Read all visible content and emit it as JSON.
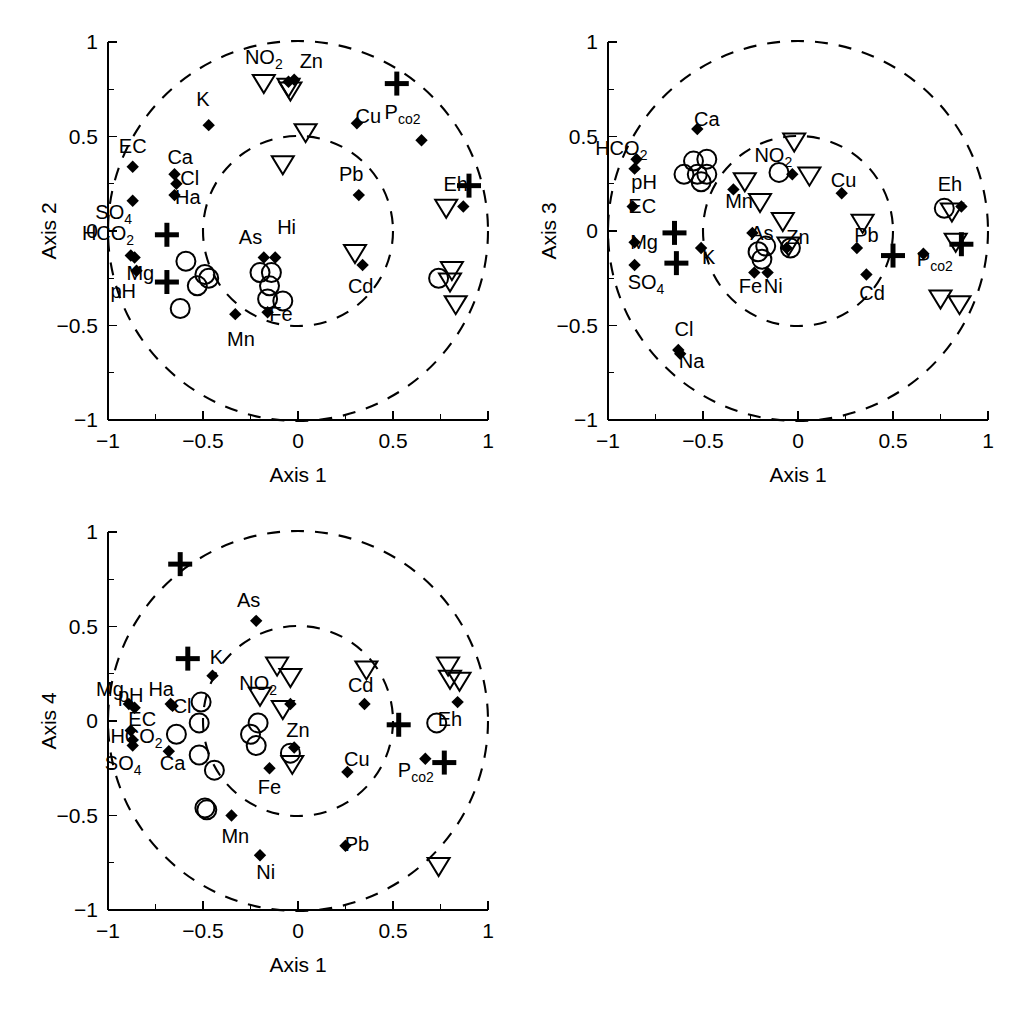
{
  "figure": {
    "panel_count": 3,
    "marker_legend": [
      "diamond",
      "open-circle",
      "open-down-triangle",
      "plus"
    ],
    "circles": [
      1.0,
      0.5
    ]
  },
  "axes": {
    "x_label": "Axis 1",
    "x_ticks": [
      "-1",
      "-0.5",
      "0",
      "0.5",
      "1"
    ],
    "x_tick_values": [
      -1,
      -0.5,
      0,
      0.5,
      1
    ],
    "y_ticks": [
      "1",
      "0.5",
      "0",
      "-0.5",
      "-1"
    ],
    "y_tick_values": [
      1,
      0.5,
      0,
      -0.5,
      -1
    ],
    "xlim": [
      -1,
      1
    ],
    "ylim": [
      -1,
      1
    ]
  },
  "chart_data": {
    "type": "scatter",
    "title": "",
    "xlabel": "Axis 1",
    "ylabel": "",
    "xlim": [
      -1,
      1
    ],
    "ylim": [
      -1,
      1
    ],
    "grid": false,
    "legend": "none",
    "annotations": {
      "unit_circle_radius": 1.0,
      "inner_circle_radius": 0.5,
      "inner_circle_center": [
        0.0,
        0.0
      ]
    },
    "panels": [
      {
        "id": "panel-axis2",
        "xlabel": "Axis 1",
        "ylabel": "Axis 2",
        "points": [
          {
            "label": "NO2",
            "marker": "diamond",
            "x": -0.05,
            "y": 0.79,
            "lx": -0.18,
            "ly": 0.92,
            "sub": "2"
          },
          {
            "label": "Zn",
            "marker": "diamond",
            "x": -0.02,
            "y": 0.8,
            "lx": 0.07,
            "ly": 0.9
          },
          {
            "label": "K",
            "marker": "diamond",
            "x": -0.47,
            "y": 0.56,
            "lx": -0.5,
            "ly": 0.7
          },
          {
            "label": "EC",
            "marker": "diamond",
            "x": -0.87,
            "y": 0.34,
            "lx": -0.87,
            "ly": 0.45
          },
          {
            "label": "Ca",
            "marker": "diamond",
            "x": -0.65,
            "y": 0.3,
            "lx": -0.62,
            "ly": 0.39
          },
          {
            "label": "Cl",
            "marker": "diamond",
            "x": -0.64,
            "y": 0.25,
            "lx": -0.57,
            "ly": 0.28
          },
          {
            "label": "Ha",
            "marker": "diamond",
            "x": -0.65,
            "y": 0.19,
            "lx": -0.58,
            "ly": 0.18
          },
          {
            "label": "SO4",
            "marker": "diamond",
            "x": -0.87,
            "y": 0.16,
            "lx": -0.97,
            "ly": 0.1,
            "sub": "4"
          },
          {
            "label": "HCO2",
            "marker": "diamond",
            "x": -0.88,
            "y": -0.13,
            "lx": -1.0,
            "ly": -0.01,
            "sub": "2"
          },
          {
            "label": "Mg",
            "marker": "diamond",
            "x": -0.86,
            "y": -0.14,
            "lx": -0.83,
            "ly": -0.22
          },
          {
            "label": "pH",
            "marker": "diamond",
            "x": -0.85,
            "y": -0.21,
            "lx": -0.92,
            "ly": -0.32
          },
          {
            "label": "Cu",
            "marker": "diamond",
            "x": 0.31,
            "y": 0.57,
            "lx": 0.37,
            "ly": 0.61
          },
          {
            "label": "Pco2",
            "marker": "diamond",
            "x": 0.65,
            "y": 0.48,
            "lx": 0.55,
            "ly": 0.63,
            "sub": "co2"
          },
          {
            "label": "Pb",
            "marker": "diamond",
            "x": 0.32,
            "y": 0.19,
            "lx": 0.28,
            "ly": 0.3
          },
          {
            "label": "Eh",
            "marker": "diamond",
            "x": 0.87,
            "y": 0.13,
            "lx": 0.83,
            "ly": 0.25
          },
          {
            "label": "As",
            "marker": "diamond",
            "x": -0.18,
            "y": -0.14,
            "lx": -0.25,
            "ly": -0.03
          },
          {
            "label": "Hi",
            "marker": "diamond",
            "x": -0.12,
            "y": -0.14,
            "lx": -0.06,
            "ly": 0.02
          },
          {
            "label": "Cd",
            "marker": "diamond",
            "x": 0.34,
            "y": -0.18,
            "lx": 0.33,
            "ly": -0.29
          },
          {
            "label": "Fe",
            "marker": "diamond",
            "x": -0.16,
            "y": -0.43,
            "lx": -0.09,
            "ly": -0.44
          },
          {
            "label": "Mn",
            "marker": "diamond",
            "x": -0.33,
            "y": -0.44,
            "lx": -0.3,
            "ly": -0.57
          }
        ],
        "circles_open": [
          [
            -0.59,
            -0.16
          ],
          [
            -0.49,
            -0.23
          ],
          [
            -0.47,
            -0.25
          ],
          [
            -0.53,
            -0.29
          ],
          [
            -0.62,
            -0.41
          ],
          [
            -0.2,
            -0.22
          ],
          [
            -0.14,
            -0.22
          ],
          [
            -0.15,
            -0.29
          ],
          [
            -0.16,
            -0.36
          ],
          [
            -0.08,
            -0.37
          ],
          [
            0.74,
            -0.25
          ]
        ],
        "triangles": [
          [
            -0.18,
            0.78
          ],
          [
            -0.05,
            0.76
          ],
          [
            -0.04,
            0.74
          ],
          [
            0.04,
            0.52
          ],
          [
            -0.08,
            0.35
          ],
          [
            0.3,
            -0.12
          ],
          [
            0.78,
            0.12
          ],
          [
            0.81,
            -0.21
          ],
          [
            0.8,
            -0.27
          ],
          [
            0.83,
            -0.39
          ]
        ],
        "plus": [
          [
            0.52,
            0.78
          ],
          [
            0.9,
            0.24
          ],
          [
            -0.69,
            -0.02
          ],
          [
            -0.69,
            -0.27
          ]
        ]
      },
      {
        "id": "panel-axis3",
        "xlabel": "Axis 1",
        "ylabel": "Axis 3",
        "points": [
          {
            "label": "Ca",
            "marker": "diamond",
            "x": -0.53,
            "y": 0.54,
            "lx": -0.48,
            "ly": 0.59
          },
          {
            "label": "HCO2",
            "marker": "diamond",
            "x": -0.85,
            "y": 0.38,
            "lx": -0.93,
            "ly": 0.44,
            "sub": "2"
          },
          {
            "label": "pH",
            "marker": "diamond",
            "x": -0.86,
            "y": 0.33,
            "lx": -0.81,
            "ly": 0.26
          },
          {
            "label": "EC",
            "marker": "diamond",
            "x": -0.87,
            "y": 0.13,
            "lx": -0.82,
            "ly": 0.13
          },
          {
            "label": "Mg",
            "marker": "diamond",
            "x": -0.86,
            "y": -0.06,
            "lx": -0.81,
            "ly": -0.06
          },
          {
            "label": "SO4",
            "marker": "diamond",
            "x": -0.86,
            "y": -0.18,
            "lx": -0.8,
            "ly": -0.27,
            "sub": "4"
          },
          {
            "label": "K",
            "marker": "diamond",
            "x": -0.51,
            "y": -0.09,
            "lx": -0.47,
            "ly": -0.14
          },
          {
            "label": "Mn",
            "marker": "diamond",
            "x": -0.34,
            "y": 0.22,
            "lx": -0.31,
            "ly": 0.16
          },
          {
            "label": "NO2",
            "marker": "diamond",
            "x": -0.03,
            "y": 0.3,
            "lx": -0.13,
            "ly": 0.4,
            "sub": "2"
          },
          {
            "label": "Cu",
            "marker": "diamond",
            "x": 0.23,
            "y": 0.2,
            "lx": 0.24,
            "ly": 0.27
          },
          {
            "label": "Eh",
            "marker": "diamond",
            "x": 0.86,
            "y": 0.13,
            "lx": 0.8,
            "ly": 0.25
          },
          {
            "label": "As",
            "marker": "diamond",
            "x": -0.24,
            "y": -0.01,
            "lx": -0.19,
            "ly": -0.01
          },
          {
            "label": "Zn",
            "marker": "diamond",
            "x": -0.06,
            "y": -0.09,
            "lx": 0.0,
            "ly": -0.03
          },
          {
            "label": "Pb",
            "marker": "diamond",
            "x": 0.31,
            "y": -0.09,
            "lx": 0.36,
            "ly": -0.02
          },
          {
            "label": "Pco2",
            "marker": "diamond",
            "x": 0.66,
            "y": -0.12,
            "lx": 0.72,
            "ly": -0.15,
            "sub": "co2"
          },
          {
            "label": "Cd",
            "marker": "diamond",
            "x": 0.36,
            "y": -0.23,
            "lx": 0.39,
            "ly": -0.33
          },
          {
            "label": "Fe",
            "marker": "diamond",
            "x": -0.23,
            "y": -0.22,
            "lx": -0.25,
            "ly": -0.29
          },
          {
            "label": "Ni",
            "marker": "diamond",
            "x": -0.16,
            "y": -0.22,
            "lx": -0.13,
            "ly": -0.29
          },
          {
            "label": "Cl",
            "marker": "diamond",
            "x": -0.63,
            "y": -0.63,
            "lx": -0.6,
            "ly": -0.52
          },
          {
            "label": "Na",
            "marker": "diamond",
            "x": -0.62,
            "y": -0.65,
            "lx": -0.56,
            "ly": -0.69
          }
        ],
        "circles_open": [
          [
            -0.55,
            0.37
          ],
          [
            -0.48,
            0.38
          ],
          [
            -0.6,
            0.3
          ],
          [
            -0.53,
            0.3
          ],
          [
            -0.48,
            0.3
          ],
          [
            -0.51,
            0.26
          ],
          [
            -0.1,
            0.31
          ],
          [
            -0.21,
            -0.11
          ],
          [
            -0.17,
            -0.08
          ],
          [
            -0.19,
            -0.15
          ],
          [
            -0.04,
            -0.09
          ],
          [
            0.77,
            0.12
          ]
        ],
        "triangles": [
          [
            -0.02,
            0.47
          ],
          [
            0.06,
            0.29
          ],
          [
            -0.28,
            0.26
          ],
          [
            -0.2,
            0.15
          ],
          [
            -0.08,
            0.05
          ],
          [
            0.34,
            0.04
          ],
          [
            0.81,
            0.1
          ],
          [
            0.83,
            -0.06
          ],
          [
            0.75,
            -0.36
          ],
          [
            0.85,
            -0.39
          ],
          [
            -0.05,
            -0.08
          ]
        ],
        "plus": [
          [
            -0.65,
            -0.01
          ],
          [
            -0.64,
            -0.17
          ],
          [
            0.5,
            -0.13
          ],
          [
            0.86,
            -0.07
          ]
        ]
      },
      {
        "id": "panel-axis4",
        "xlabel": "Axis 1",
        "ylabel": "Axis 4",
        "points": [
          {
            "label": "As",
            "marker": "diamond",
            "x": -0.22,
            "y": 0.53,
            "lx": -0.26,
            "ly": 0.64
          },
          {
            "label": "K",
            "marker": "diamond",
            "x": -0.45,
            "y": 0.24,
            "lx": -0.43,
            "ly": 0.34
          },
          {
            "label": "Mg",
            "marker": "diamond",
            "x": -0.89,
            "y": 0.09,
            "lx": -0.99,
            "ly": 0.17
          },
          {
            "label": "pH",
            "marker": "diamond",
            "x": -0.86,
            "y": 0.07,
            "lx": -0.88,
            "ly": 0.14
          },
          {
            "label": "Ha",
            "marker": "diamond",
            "x": -0.67,
            "y": 0.09,
            "lx": -0.72,
            "ly": 0.17
          },
          {
            "label": "Cl",
            "marker": "diamond",
            "x": -0.66,
            "y": 0.08,
            "lx": -0.61,
            "ly": 0.08
          },
          {
            "label": "EC",
            "marker": "diamond",
            "x": -0.88,
            "y": -0.05,
            "lx": -0.82,
            "ly": 0.01
          },
          {
            "label": "HCO2",
            "marker": "diamond",
            "x": -0.87,
            "y": -0.1,
            "lx": -0.85,
            "ly": -0.08,
            "sub": "2"
          },
          {
            "label": "SO4",
            "marker": "diamond",
            "x": -0.87,
            "y": -0.13,
            "lx": -0.92,
            "ly": -0.22,
            "sub": "4"
          },
          {
            "label": "Ca",
            "marker": "diamond",
            "x": -0.68,
            "y": -0.16,
            "lx": -0.66,
            "ly": -0.22
          },
          {
            "label": "NO2",
            "marker": "diamond",
            "x": -0.04,
            "y": 0.09,
            "lx": -0.21,
            "ly": 0.2,
            "sub": "2"
          },
          {
            "label": "Zn",
            "marker": "diamond",
            "x": -0.02,
            "y": -0.14,
            "lx": 0.0,
            "ly": -0.05
          },
          {
            "label": "Cd",
            "marker": "diamond",
            "x": 0.35,
            "y": 0.09,
            "lx": 0.33,
            "ly": 0.19
          },
          {
            "label": "Eh",
            "marker": "diamond",
            "x": 0.84,
            "y": 0.1,
            "lx": 0.8,
            "ly": 0.01
          },
          {
            "label": "Cu",
            "marker": "diamond",
            "x": 0.26,
            "y": -0.27,
            "lx": 0.31,
            "ly": -0.2
          },
          {
            "label": "Pco2",
            "marker": "diamond",
            "x": 0.67,
            "y": -0.2,
            "lx": 0.62,
            "ly": -0.26,
            "sub": "co2"
          },
          {
            "label": "Fe",
            "marker": "diamond",
            "x": -0.15,
            "y": -0.25,
            "lx": -0.15,
            "ly": -0.35
          },
          {
            "label": "Mn",
            "marker": "diamond",
            "x": -0.35,
            "y": -0.5,
            "lx": -0.33,
            "ly": -0.61
          },
          {
            "label": "Ni",
            "marker": "diamond",
            "x": -0.2,
            "y": -0.71,
            "lx": -0.17,
            "ly": -0.8
          },
          {
            "label": "Pb",
            "marker": "diamond",
            "x": 0.25,
            "y": -0.66,
            "lx": 0.31,
            "ly": -0.65
          }
        ],
        "circles_open": [
          [
            -0.51,
            0.1
          ],
          [
            -0.52,
            -0.01
          ],
          [
            -0.64,
            -0.07
          ],
          [
            -0.52,
            -0.18
          ],
          [
            -0.44,
            -0.26
          ],
          [
            -0.21,
            -0.01
          ],
          [
            -0.25,
            -0.07
          ],
          [
            -0.22,
            -0.13
          ],
          [
            -0.04,
            -0.17
          ],
          [
            0.73,
            -0.01
          ],
          [
            -0.49,
            -0.46
          ],
          [
            -0.48,
            -0.47
          ]
        ],
        "triangles": [
          [
            -0.11,
            0.29
          ],
          [
            -0.04,
            0.23
          ],
          [
            -0.2,
            0.13
          ],
          [
            -0.08,
            0.06
          ],
          [
            0.36,
            0.27
          ],
          [
            0.79,
            0.29
          ],
          [
            0.8,
            0.22
          ],
          [
            0.85,
            0.21
          ],
          [
            -0.03,
            -0.23
          ],
          [
            0.74,
            -0.77
          ]
        ],
        "plus": [
          [
            -0.62,
            0.83
          ],
          [
            -0.58,
            0.33
          ],
          [
            0.53,
            -0.02
          ],
          [
            0.77,
            -0.22
          ]
        ]
      }
    ]
  },
  "ghost_text": {
    "line1": " ",
    "line2": " "
  }
}
